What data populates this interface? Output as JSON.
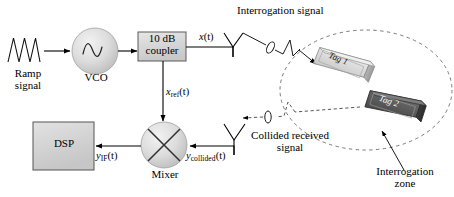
{
  "figure": {
    "type": "block-diagram",
    "background_color": "#ffffff",
    "line_color": "#000000",
    "dashed_color": "#555555"
  },
  "blocks": {
    "ramp": {
      "label_line1": "Ramp",
      "label_line2": "signal",
      "icon": "sawtooth-waveform"
    },
    "vco": {
      "label": "VCO",
      "icon": "sine-wave-circle",
      "fill": "#d8d8d8"
    },
    "coupler": {
      "label_line1": "10 dB",
      "label_line2": "coupler",
      "fill": "#d0d0d0"
    },
    "dsp": {
      "label": "DSP",
      "fill": "#d4d4d4"
    },
    "mixer": {
      "label": "Mixer",
      "icon": "mixer-cross-circle",
      "fill": "#d2d2d2"
    }
  },
  "signals": {
    "x_of_t": "x(t)",
    "x_ref_of_t": "xref(t)",
    "y_if_of_t": "yIF(t)",
    "y_collided_of_t": "ycollided(t)"
  },
  "signal_parts": {
    "x": {
      "base": "x",
      "sub": "",
      "arg": "(t)"
    },
    "x_ref": {
      "base": "x",
      "sub": "ref",
      "arg": "(t)"
    },
    "y_if": {
      "base": "y",
      "sub": "IF",
      "arg": "(t)"
    },
    "y_collided": {
      "base": "y",
      "sub": "collided",
      "arg": "(t)"
    }
  },
  "annotations": {
    "interrogation_signal": "Interrogation signal",
    "collided_received_line1": "Collided received",
    "collided_received_line2": "signal",
    "interrogation_zone_line1": "Interrogation",
    "interrogation_zone_line2": "zone"
  },
  "tags": [
    {
      "name": "Tag 1",
      "fill": "#d9d9d9",
      "text_color": "#1a1a1a"
    },
    {
      "name": "Tag 2",
      "fill": "#5a5a5a",
      "text_color": "#ffffff"
    }
  ],
  "antennas": [
    {
      "name": "transmit-antenna",
      "shape": "dipole-y"
    },
    {
      "name": "receive-antenna",
      "shape": "dipole-y"
    }
  ],
  "zone": {
    "shape": "ellipse",
    "stroke": "dashed",
    "label": "Interrogation zone"
  }
}
